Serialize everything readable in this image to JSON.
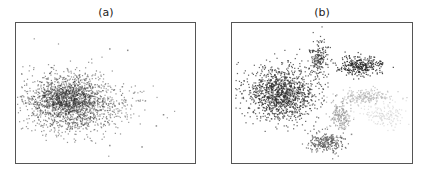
{
  "chart_data": [
    {
      "type": "scatter",
      "title": "(a)",
      "xlabel": "",
      "ylabel": "",
      "axes_ticks": false,
      "grid": false,
      "legend": null,
      "description": "Single diffuse blob of overlapping points centered left-of-center, with sparse outliers trailing to the right",
      "frame": {
        "left": 15,
        "top": 22,
        "width": 181,
        "height": 142
      },
      "clusters": [
        {
          "cx": 0.3,
          "cy": 0.57,
          "sx": 0.13,
          "sy": 0.11,
          "n": 1400,
          "color": "#3a3a3a",
          "alpha": 0.55
        },
        {
          "cx": 0.28,
          "cy": 0.54,
          "sx": 0.08,
          "sy": 0.07,
          "n": 600,
          "color": "#2a2a2a",
          "alpha": 0.6
        },
        {
          "cx": 0.55,
          "cy": 0.58,
          "sx": 0.12,
          "sy": 0.08,
          "n": 120,
          "color": "#444444",
          "alpha": 0.5
        }
      ],
      "outliers": [
        [
          0.52,
          0.18
        ],
        [
          0.62,
          0.19
        ],
        [
          0.82,
          0.65
        ],
        [
          0.78,
          0.73
        ],
        [
          0.52,
          0.87
        ],
        [
          0.7,
          0.88
        ],
        [
          0.59,
          0.45
        ]
      ]
    },
    {
      "type": "scatter",
      "title": "(b)",
      "xlabel": "",
      "ylabel": "",
      "axes_ticks": false,
      "grid": false,
      "legend": null,
      "description": "Well-separated clusters: large dark cluster left, small vertical cluster top-middle, dark cluster top-right, light gray clusters right-middle, medium-gray clusters bottom-middle",
      "frame": {
        "left": 231,
        "top": 22,
        "width": 182,
        "height": 142
      },
      "clusters": [
        {
          "cx": 0.27,
          "cy": 0.5,
          "sx": 0.1,
          "sy": 0.09,
          "n": 1300,
          "color": "#2e2e2e",
          "alpha": 0.75
        },
        {
          "cx": 0.48,
          "cy": 0.25,
          "sx": 0.025,
          "sy": 0.07,
          "n": 180,
          "color": "#3a3a3a",
          "alpha": 0.8
        },
        {
          "cx": 0.71,
          "cy": 0.3,
          "sx": 0.06,
          "sy": 0.035,
          "n": 300,
          "color": "#222222",
          "alpha": 0.85
        },
        {
          "cx": 0.74,
          "cy": 0.52,
          "sx": 0.07,
          "sy": 0.025,
          "n": 200,
          "color": "#b0b0b0",
          "alpha": 0.7
        },
        {
          "cx": 0.6,
          "cy": 0.66,
          "sx": 0.03,
          "sy": 0.05,
          "n": 180,
          "color": "#9a9a9a",
          "alpha": 0.75
        },
        {
          "cx": 0.85,
          "cy": 0.66,
          "sx": 0.06,
          "sy": 0.04,
          "n": 160,
          "color": "#d0d0d0",
          "alpha": 0.6
        },
        {
          "cx": 0.52,
          "cy": 0.85,
          "sx": 0.05,
          "sy": 0.035,
          "n": 260,
          "color": "#5a5a5a",
          "alpha": 0.8
        }
      ],
      "outliers": [
        [
          0.22,
          0.33
        ],
        [
          0.4,
          0.31
        ],
        [
          0.66,
          0.79
        ],
        [
          0.45,
          0.73
        ]
      ]
    }
  ]
}
